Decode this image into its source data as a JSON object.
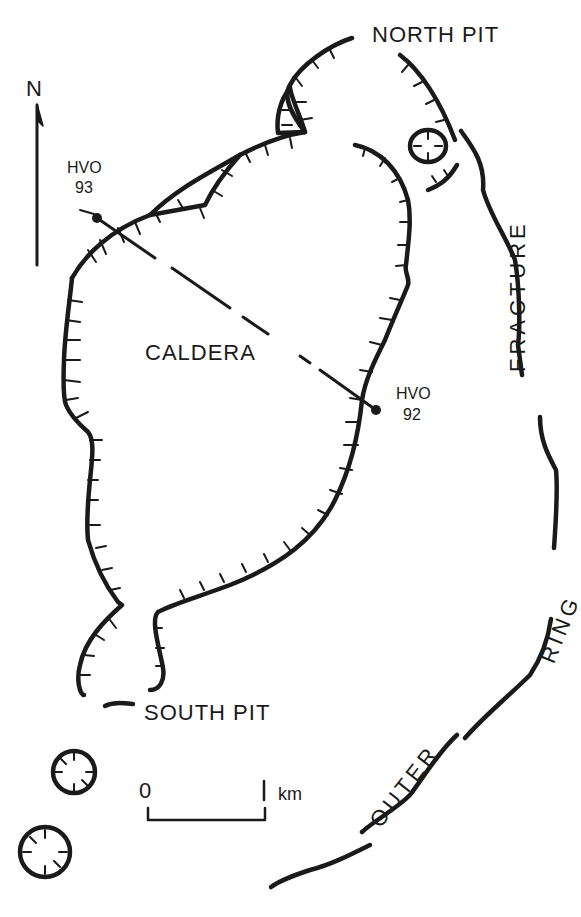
{
  "labels": {
    "north_pit": "NORTH PIT",
    "south_pit": "SOUTH PIT",
    "caldera": "CALDERA",
    "fracture": "FRACTURE",
    "ring": "RING",
    "outer": "OUTER",
    "north_arrow": "N"
  },
  "stations": [
    {
      "name": "HVO",
      "number": "93"
    },
    {
      "name": "HVO",
      "number": "92"
    }
  ],
  "scale_bar": {
    "start": "0",
    "end": "1",
    "unit": "km"
  },
  "colors": {
    "ink": "#1a1a1a",
    "background": "#ffffff"
  }
}
